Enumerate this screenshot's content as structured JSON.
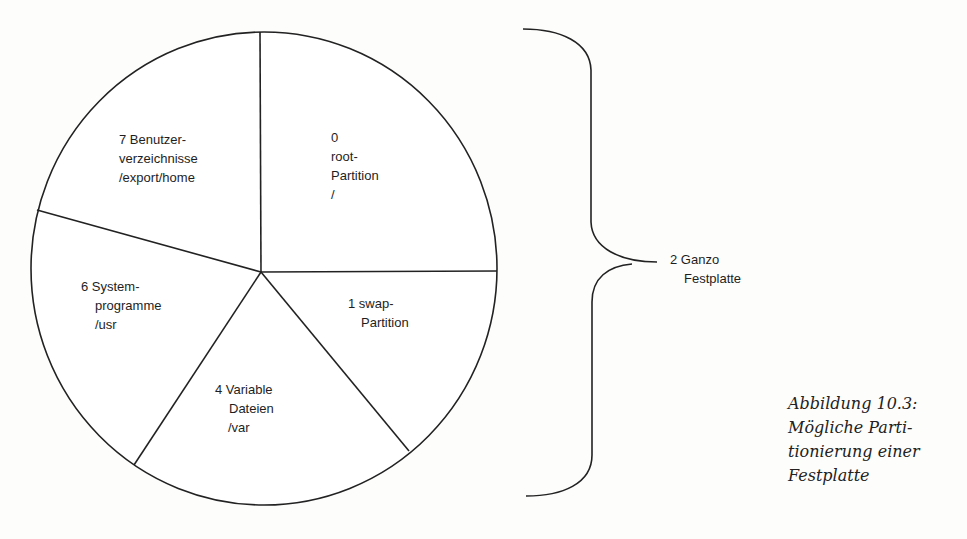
{
  "diagram": {
    "type": "pie-partition-diagram",
    "stroke_color": "#222222",
    "background_color": "#fdfdfc",
    "slices": [
      {
        "id": "slice-0",
        "lines": [
          "0",
          "root-",
          "Partition",
          "/"
        ]
      },
      {
        "id": "slice-1",
        "lines": [
          "1 swap-",
          "Partition"
        ]
      },
      {
        "id": "slice-4",
        "lines": [
          "4 Variable",
          "Dateien",
          "/var"
        ]
      },
      {
        "id": "slice-6",
        "lines": [
          "6 System-",
          "programme",
          "/usr"
        ]
      },
      {
        "id": "slice-7",
        "lines": [
          "7 Benutzer-",
          "verzeichnisse",
          "/export/home"
        ]
      }
    ],
    "brace_label": {
      "lines": [
        "2 Ganzo",
        "Festplatte"
      ]
    }
  },
  "caption": {
    "lines": [
      "Abbildung 10.3:",
      "Mögliche Parti-",
      "tionierung einer",
      "Festplatte"
    ]
  }
}
